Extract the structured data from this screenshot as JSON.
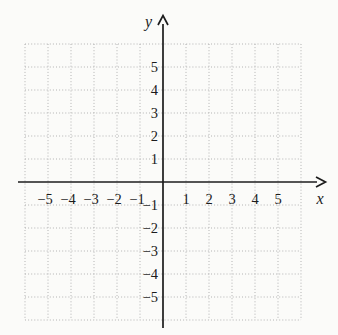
{
  "figure": {
    "background": "#fbfbf9",
    "grid_color": "#b3b3b3",
    "axis_color": "#1c1c1c",
    "text_color": "#1c1c1c"
  },
  "chart_data": {
    "type": "scatter",
    "series": [],
    "title": "",
    "xlabel": "x",
    "ylabel": "y",
    "xlim": [
      -6,
      6
    ],
    "ylim": [
      -6,
      6
    ],
    "x_ticks": [
      -5,
      -4,
      -3,
      -2,
      -1,
      1,
      2,
      3,
      4,
      5
    ],
    "y_ticks": [
      -5,
      -4,
      -3,
      -2,
      -1,
      1,
      2,
      3,
      4,
      5
    ],
    "grid": "dotted",
    "legend": "none"
  }
}
